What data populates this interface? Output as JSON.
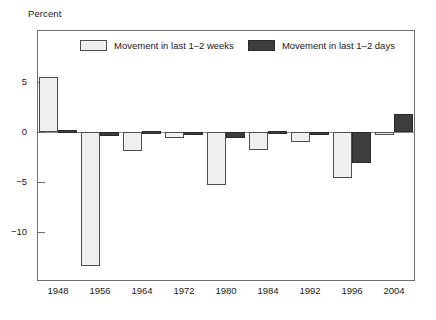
{
  "chart_data": {
    "type": "bar",
    "title": "",
    "subtitle": "",
    "xlabel": "",
    "ylabel": "Percent",
    "ylim": [
      -15.1,
      10.1
    ],
    "yticks": [
      5,
      0,
      -5,
      -10
    ],
    "ytick_labels": [
      "5",
      "0",
      "−5",
      "−10"
    ],
    "grid": false,
    "legend_position": "top-center",
    "categories": [
      "1948",
      "1956",
      "1964",
      "1972",
      "1980",
      "1984",
      "1992",
      "1996",
      "2004"
    ],
    "series": [
      {
        "name": "Movement in last 1–2 weeks",
        "color": "#efefef",
        "values": [
          5.5,
          -13.4,
          -1.9,
          -0.6,
          -5.3,
          -1.8,
          -1.0,
          -4.6,
          -0.3
        ]
      },
      {
        "name": "Movement in last 1–2 days",
        "color": "#3d3d3d",
        "values": [
          0.2,
          -0.4,
          0.1,
          -0.1,
          -0.6,
          0.1,
          -0.3,
          -3.1,
          1.8
        ]
      }
    ]
  },
  "axes": {
    "y_axis_title": "Percent"
  },
  "legend": {
    "items": [
      {
        "label": "Movement in last 1–2 weeks",
        "swatch": "light"
      },
      {
        "label": "Movement in last 1–2 days",
        "swatch": "dark"
      }
    ]
  }
}
